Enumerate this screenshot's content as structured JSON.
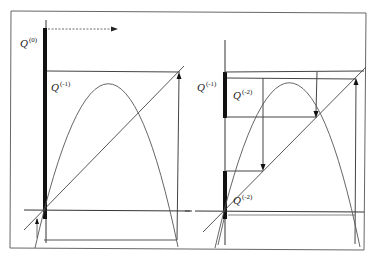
{
  "figure": {
    "colors": {
      "line": "#555555",
      "thick_bar": "#111111",
      "frame": "#666666",
      "background": "#ffffff"
    }
  },
  "left_panel": {
    "labels": {
      "q0_base": "Q",
      "q0_sup": "(0)",
      "qm1_base": "Q",
      "qm1_sup": "(-1)"
    },
    "arrow": "dotted-right-arrow"
  },
  "right_panel": {
    "labels": {
      "qm1_base": "Q",
      "qm1_sup": "(-1)",
      "qm2_top_base": "Q",
      "qm2_top_sup": "(-2)",
      "qm2_bottom_base": "Q",
      "qm2_bottom_sup": "(-2)"
    }
  }
}
